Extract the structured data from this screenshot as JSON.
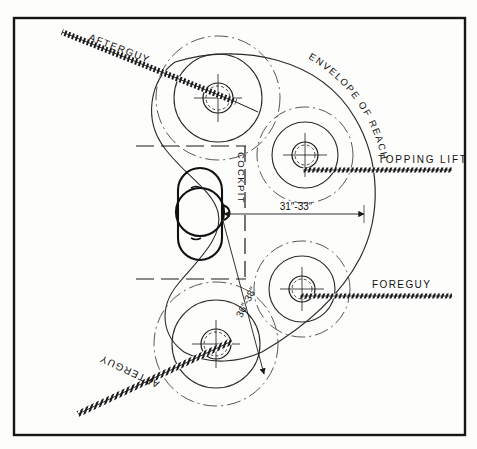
{
  "drawing": {
    "title": "Sailing yacht deck plan — winch positions and envelope of reach",
    "background_color": "#fdfdfc",
    "ink_color": "#1a1a1a",
    "border": {
      "name": "drawing-border",
      "x": 14,
      "y": 18,
      "width": 451,
      "height": 417
    }
  },
  "labels": {
    "afterguy_top": "AFTERGUY",
    "afterguy_bottom": "AFTERGUY",
    "envelope_of_reach": "ENVELOPE OF REACH",
    "topping_lift": "TOPPING LIFT",
    "foreguy": "FOREGUY",
    "cockpit": "COCKPIT"
  },
  "dimensions": {
    "reach_upper": "31″-33″",
    "reach_lower": "36″-38″"
  },
  "envelope_letters": {
    "text": "ENVELOPE OF REACH",
    "chars": [
      "E",
      "N",
      "V",
      "E",
      "L",
      "O",
      "P",
      "E",
      " ",
      "O",
      "F",
      " ",
      "R",
      "E",
      "A",
      "C",
      "H"
    ]
  },
  "winches": [
    {
      "name": "winch-upper-left",
      "cx": 218,
      "cy": 98,
      "r_outer": 62,
      "r_mid": 44,
      "r_hub": 15,
      "r_drum": 12
    },
    {
      "name": "winch-upper-right",
      "cx": 305,
      "cy": 155,
      "r_outer": 48,
      "r_mid": 32,
      "r_hub": 13,
      "r_drum": 10
    },
    {
      "name": "winch-lower-right",
      "cx": 302,
      "cy": 289,
      "r_outer": 48,
      "r_mid": 32,
      "r_hub": 13,
      "r_drum": 10
    },
    {
      "name": "winch-lower-left",
      "cx": 216,
      "cy": 344,
      "r_outer": 62,
      "r_mid": 44,
      "r_hub": 15,
      "r_drum": 12
    }
  ],
  "rig_lines": [
    {
      "name": "afterguy-top-line",
      "x1": 62,
      "y1": 32,
      "x2": 232,
      "y2": 100
    },
    {
      "name": "afterguy-bottom-line",
      "x1": 78,
      "y1": 412,
      "x2": 228,
      "y2": 343
    },
    {
      "name": "topping-lift-line",
      "x1": 303,
      "y1": 170,
      "x2": 452,
      "y2": 170
    },
    {
      "name": "foreguy-line",
      "x1": 300,
      "y1": 296,
      "x2": 452,
      "y2": 296
    }
  ],
  "cockpit_outline": {
    "name": "cockpit-body",
    "cx": 200,
    "cy": 213,
    "rx": 22,
    "ry": 45,
    "helm_circle": {
      "cx": 200,
      "cy": 212,
      "r": 24
    }
  }
}
